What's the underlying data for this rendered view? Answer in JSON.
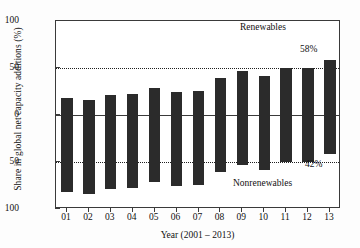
{
  "chart_data": {
    "type": "bar",
    "title": "",
    "subtitle": "",
    "xlabel": "Year (2001 – 2013)",
    "ylabel": "Share in global net capacity additions (%)",
    "categories": [
      "01",
      "02",
      "03",
      "04",
      "05",
      "06",
      "07",
      "08",
      "09",
      "10",
      "11",
      "12",
      "13"
    ],
    "series": [
      {
        "name": "Renewables",
        "values": [
          18.5,
          16,
          21,
          22,
          29,
          25,
          26,
          39,
          47,
          41,
          50,
          50,
          58
        ]
      },
      {
        "name": "Nonrenewables",
        "values": [
          -81.5,
          -84,
          -79,
          -78,
          -71,
          -75,
          -74,
          -61,
          -53,
          -59,
          -50,
          -50,
          -42
        ]
      }
    ],
    "ylim": [
      -100,
      100
    ],
    "ytick_labels": [
      "100",
      "50",
      "0",
      "50",
      "100"
    ],
    "ytick_values": [
      100,
      50,
      0,
      -50,
      -100
    ],
    "xtick_labels": [
      "01",
      "02",
      "03",
      "04",
      "05",
      "06",
      "07",
      "08",
      "09",
      "10",
      "11",
      "12",
      "13"
    ],
    "grid": "dotted horizontal lines at +50 and -50",
    "legend_position": "inline annotations",
    "bar_color": "#2b2b2b",
    "frame_color": "#3a3a3a",
    "background_color": "#ffffff",
    "annotations": [
      {
        "name": "renewables-label",
        "text": "Renewables"
      },
      {
        "name": "nonrenewables-label",
        "text": "Nonrenewables"
      },
      {
        "name": "top-value-label",
        "text": "58%"
      },
      {
        "name": "bottom-value-label",
        "text": "42%"
      }
    ]
  }
}
